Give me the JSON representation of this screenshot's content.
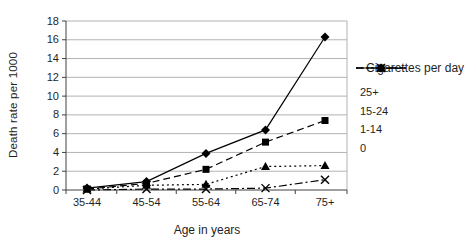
{
  "chart_data": {
    "type": "line",
    "title": "",
    "xlabel": "Age in years",
    "ylabel": "Death rate per 1000",
    "categories": [
      "35-44",
      "45-54",
      "55-64",
      "65-74",
      "75+"
    ],
    "ylim": [
      0,
      18
    ],
    "yticks": [
      0,
      2,
      4,
      6,
      8,
      10,
      12,
      14,
      16,
      18
    ],
    "grid": "horizontal",
    "legend_title": "Cigarettes per day",
    "legend_position": "right",
    "series": [
      {
        "name": "25+",
        "marker": "diamond",
        "line": "solid",
        "values": [
          0.2,
          0.9,
          3.9,
          6.4,
          16.3
        ]
      },
      {
        "name": "15-24",
        "marker": "square",
        "line": "dashed",
        "values": [
          0.1,
          0.7,
          2.2,
          5.1,
          7.4
        ]
      },
      {
        "name": "1-14",
        "marker": "triangle",
        "line": "dotted",
        "values": [
          0.1,
          0.5,
          0.6,
          2.5,
          2.6
        ]
      },
      {
        "name": "0",
        "marker": "x",
        "line": "dashdot",
        "values": [
          0.0,
          0.1,
          0.1,
          0.2,
          1.1
        ]
      }
    ],
    "colors": {
      "series": "#000000",
      "grid": "#b3b3b3",
      "axis": "#404040",
      "text": "#1f1f1f",
      "background": "#ffffff"
    }
  }
}
